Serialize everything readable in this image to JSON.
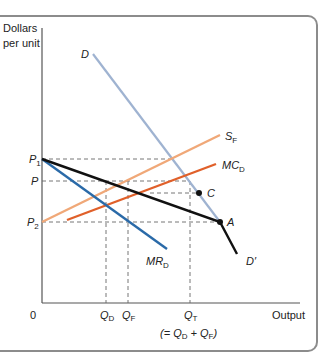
{
  "diagram": {
    "type": "economics-graph",
    "y_axis_label_line1": "Dollars",
    "y_axis_label_line2": "per unit",
    "x_axis_label": "Output",
    "origin_label": "0",
    "price_labels": {
      "p1": {
        "main": "P",
        "sub": "1"
      },
      "p": {
        "main": "P",
        "sub": ""
      },
      "p2": {
        "main": "P",
        "sub": "2"
      }
    },
    "quantity_labels": {
      "qd": {
        "main": "Q",
        "sub": "D"
      },
      "qf": {
        "main": "Q",
        "sub": "F"
      },
      "qt": {
        "main": "Q",
        "sub": "T"
      },
      "qt_note_prefix": "(= ",
      "qt_note_q1": "Q",
      "qt_note_sub1": "D",
      "qt_note_plus": " + ",
      "qt_note_q2": "Q",
      "qt_note_sub2": "F",
      "qt_note_suffix": ")"
    },
    "curves": {
      "d": {
        "label": "D",
        "color": "#9fb3d1"
      },
      "d_prime": {
        "label": "D′",
        "color": "#111111"
      },
      "sf": {
        "label_main": "S",
        "label_sub": "F",
        "color": "#f0a878"
      },
      "mcd": {
        "label_main": "MC",
        "label_sub": "D",
        "color": "#e0602a"
      },
      "mrd": {
        "label_main": "MR",
        "label_sub": "D",
        "color": "#2a6aa8"
      }
    },
    "points": {
      "a": {
        "label": "A"
      },
      "c": {
        "label": "C"
      }
    }
  }
}
